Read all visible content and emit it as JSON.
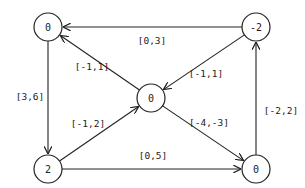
{
  "diagram": {
    "type": "directed-graph",
    "nodes": [
      {
        "id": "tl",
        "label": "0"
      },
      {
        "id": "tr",
        "label": "-2"
      },
      {
        "id": "c",
        "label": "0"
      },
      {
        "id": "bl",
        "label": "2"
      },
      {
        "id": "br",
        "label": "0"
      }
    ],
    "edges": [
      {
        "from": "tr",
        "to": "tl",
        "label": "[0,3]"
      },
      {
        "from": "c",
        "to": "tl",
        "label": "[-1,1]"
      },
      {
        "from": "tr",
        "to": "c",
        "label": "[-1,1]"
      },
      {
        "from": "tl",
        "to": "bl",
        "label": "[3,6]"
      },
      {
        "from": "bl",
        "to": "c",
        "label": "[-1,2]"
      },
      {
        "from": "c",
        "to": "br",
        "label": "[-4,-3]"
      },
      {
        "from": "bl",
        "to": "br",
        "label": "[0,5]"
      },
      {
        "from": "br",
        "to": "tr",
        "label": "[-2,2]"
      }
    ]
  }
}
